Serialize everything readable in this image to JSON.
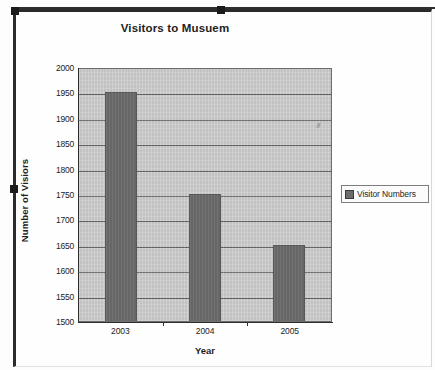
{
  "document": {
    "object_type": "embedded-chart",
    "selected": true
  },
  "chart_data": {
    "type": "bar",
    "title": "Visitors to Musuem",
    "xlabel": "Year",
    "ylabel": "Number of Visiors",
    "categories": [
      "2003",
      "2004",
      "2005"
    ],
    "values": [
      1950,
      1750,
      1650
    ],
    "series": [
      {
        "name": "Visitor Numbers",
        "values": [
          1950,
          1750,
          1650
        ]
      }
    ],
    "ylim": [
      1500,
      2000
    ],
    "ytick_step": 50,
    "yticks": [
      2000,
      1950,
      1900,
      1850,
      1800,
      1750,
      1700,
      1650,
      1600,
      1550,
      1500
    ],
    "grid": true,
    "legend_position": "right",
    "colors": {
      "bar": "#6c6c6c",
      "plot_background": "#c9c9c9",
      "gridline": "#5d5d5d",
      "axis": "#2e2e2e",
      "text": "#1f1f1f",
      "frame": "#2b2b2b"
    }
  },
  "legend": {
    "entries": [
      {
        "label": "Visitor Numbers",
        "swatch_color": "#6c6c6c"
      }
    ]
  },
  "handles": [
    {
      "name": "top-left",
      "label": ""
    },
    {
      "name": "top-center",
      "label": ""
    },
    {
      "name": "left-middle",
      "label": ""
    }
  ]
}
